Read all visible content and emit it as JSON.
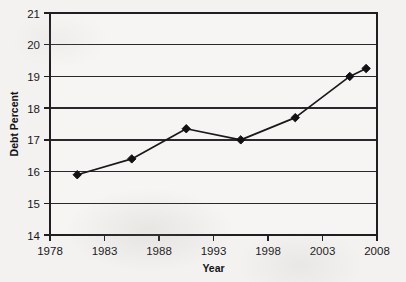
{
  "chart_data": {
    "type": "line",
    "title": "",
    "xlabel": "Year",
    "ylabel": "Debt Percent",
    "xlim": [
      1978,
      2008
    ],
    "ylim": [
      14,
      21
    ],
    "xticks": [
      1978,
      1983,
      1988,
      1993,
      1998,
      2003,
      2008
    ],
    "yticks": [
      14,
      15,
      16,
      17,
      18,
      19,
      20,
      21
    ],
    "grid": "horizontal",
    "legend": "none",
    "marker": "diamond",
    "line_color": "#1a181b",
    "marker_color": "#111013",
    "background_color": "#f3f2f0",
    "x": [
      1980.5,
      1985.5,
      1990.5,
      1995.5,
      2000.5,
      2005.5,
      2007.0
    ],
    "values": [
      15.9,
      16.4,
      17.35,
      17.0,
      17.7,
      19.0,
      19.25
    ],
    "series": [
      {
        "name": "Debt Percent",
        "points": [
          {
            "x": 1980.5,
            "y": 15.9
          },
          {
            "x": 1985.5,
            "y": 16.4
          },
          {
            "x": 1990.5,
            "y": 17.35
          },
          {
            "x": 1995.5,
            "y": 17.0
          },
          {
            "x": 2000.5,
            "y": 17.7
          },
          {
            "x": 2005.5,
            "y": 19.0
          },
          {
            "x": 2007.0,
            "y": 19.25
          }
        ]
      }
    ]
  },
  "axis": {
    "y_tick_labels": [
      "21",
      "20",
      "19",
      "18",
      "17",
      "16",
      "15",
      "14"
    ],
    "x_tick_labels": [
      "1978",
      "1983",
      "1988",
      "1993",
      "1998",
      "2003",
      "2008"
    ],
    "x_title": "Year",
    "y_title": "Debt Percent"
  }
}
